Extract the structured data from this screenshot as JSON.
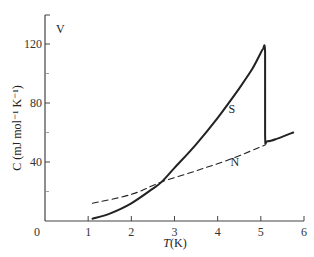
{
  "chart_data": {
    "type": "line",
    "title": "",
    "panel_label": "V",
    "xlabel": "T(K)",
    "xlabel_italic_part": "T",
    "xlabel_unit": "(K)",
    "ylabel": "C (mJ mol⁻¹ K⁻¹)",
    "xlim": [
      0,
      6
    ],
    "ylim": [
      0,
      140
    ],
    "x_ticks": [
      0,
      1,
      2,
      3,
      4,
      5,
      6
    ],
    "x_tick_labels": [
      "0",
      "1",
      "2",
      "3",
      "4",
      "5",
      "6"
    ],
    "y_ticks_major": [
      40,
      80,
      120
    ],
    "y_tick_labels": [
      "40",
      "80",
      "120"
    ],
    "y_ticks_minor": [
      20,
      60,
      100
    ],
    "grid": false,
    "legend": "none (curves labeled inline)",
    "series": [
      {
        "name": "S",
        "style": "solid",
        "color": "#222222",
        "label_pos": [
          4.25,
          73
        ],
        "x": [
          1.1,
          1.5,
          2.0,
          2.5,
          2.7,
          3.0,
          3.5,
          4.0,
          4.5,
          4.8,
          5.0,
          5.05,
          5.1,
          5.1,
          5.15,
          5.4,
          5.75
        ],
        "y": [
          1.5,
          5,
          12,
          22,
          26.5,
          36,
          52,
          70,
          90,
          103,
          114,
          116.5,
          114,
          58,
          54,
          56,
          60
        ]
      },
      {
        "name": "N",
        "style": "dashed",
        "color": "#222222",
        "label_pos": [
          4.3,
          37
        ],
        "x": [
          1.1,
          2.0,
          2.7,
          3.5,
          4.3,
          5.1
        ],
        "y": [
          12,
          18,
          26.5,
          34,
          42,
          51.5
        ]
      }
    ]
  }
}
